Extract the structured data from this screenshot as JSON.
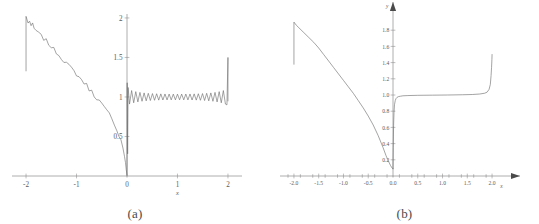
{
  "figure": {
    "background": "#ffffff",
    "curve_color": "#6b6b6b",
    "axis_color": "#7d7d7d",
    "text_color": "#5c5c5c"
  },
  "panels": [
    {
      "id": "a",
      "caption": "(a)",
      "xlabel": "x",
      "ylabel": "",
      "xticks": [
        "-2",
        "-1",
        "0",
        "1",
        "2"
      ],
      "xtick_values": [
        -2,
        -1,
        0,
        1,
        2
      ],
      "yticks": [
        "0.5",
        "1",
        "1.5",
        "2"
      ],
      "ytick_values": [
        0.5,
        1,
        1.5,
        2
      ],
      "xlim": [
        -2.08,
        2.08
      ],
      "ylim": [
        0,
        2.05
      ],
      "grid": "off",
      "axis_arrows": "none"
    },
    {
      "id": "b",
      "caption": "(b)",
      "xlabel": "x",
      "ylabel": "y",
      "xticks": [
        "-2.0",
        "-1.5",
        "-1.0",
        "-0.5",
        "0.0",
        "0.5",
        "1.0",
        "1.5",
        "2.0"
      ],
      "xtick_values": [
        -2.0,
        -1.5,
        -1.0,
        -0.5,
        0.0,
        0.5,
        1.0,
        1.5,
        2.0
      ],
      "yticks": [
        "0.2",
        "0.4",
        "0.6",
        "0.8",
        "1.0",
        "1.2",
        "1.4",
        "1.6",
        "1.8"
      ],
      "ytick_values": [
        0.2,
        0.4,
        0.6,
        0.8,
        1.0,
        1.2,
        1.4,
        1.6,
        1.8
      ],
      "xlim": [
        -2.12,
        2.12
      ],
      "ylim": [
        0,
        2.0
      ],
      "grid": "off",
      "axis_arrows": "both"
    }
  ],
  "chart_data": [
    {
      "type": "line",
      "panel": "a",
      "title": "",
      "subtitle": "",
      "xlabel": "x",
      "ylabel": "",
      "xlim": [
        -2.08,
        2.08
      ],
      "ylim": [
        0,
        2.05
      ],
      "grid": false,
      "legend": "none",
      "annotations": [
        "(a)"
      ],
      "description": "Noisy/oscillatory approximation: left branch rises vertically at x=-2 to about 2.0 then descends with jagged noise to ~0 at x=0; right branch oscillates about y=1 with ripples and spikes up to ~1.5 at x=2.",
      "series": [
        {
          "name": "left-branch",
          "x": [
            -2.0,
            -2.0,
            -1.96,
            -1.93,
            -1.9,
            -1.87,
            -1.84,
            -1.8,
            -1.75,
            -1.7,
            -1.65,
            -1.6,
            -1.55,
            -1.5,
            -1.45,
            -1.4,
            -1.35,
            -1.3,
            -1.25,
            -1.2,
            -1.15,
            -1.1,
            -1.05,
            -1.0,
            -0.95,
            -0.9,
            -0.85,
            -0.8,
            -0.75,
            -0.7,
            -0.65,
            -0.6,
            -0.55,
            -0.5,
            -0.45,
            -0.4,
            -0.35,
            -0.3,
            -0.25,
            -0.2,
            -0.16,
            -0.12,
            -0.08,
            -0.05,
            -0.03,
            -0.015,
            0.0
          ],
          "y": [
            1.33,
            2.02,
            1.93,
            1.97,
            1.9,
            1.91,
            1.86,
            1.84,
            1.8,
            1.77,
            1.74,
            1.71,
            1.67,
            1.64,
            1.6,
            1.57,
            1.53,
            1.5,
            1.46,
            1.43,
            1.39,
            1.36,
            1.32,
            1.29,
            1.25,
            1.22,
            1.18,
            1.15,
            1.1,
            1.07,
            1.02,
            0.99,
            0.95,
            0.91,
            0.86,
            0.82,
            0.78,
            0.71,
            0.67,
            0.58,
            0.52,
            0.45,
            0.36,
            0.26,
            0.17,
            0.08,
            0.01
          ]
        },
        {
          "name": "right-branch",
          "x": [
            0.0,
            0.01,
            0.02,
            0.04,
            0.06,
            0.09,
            0.12,
            0.16,
            0.2,
            0.26,
            0.33,
            0.4,
            0.5,
            0.6,
            0.7,
            0.8,
            0.9,
            1.0,
            1.1,
            1.2,
            1.3,
            1.4,
            1.5,
            1.6,
            1.7,
            1.8,
            1.85,
            1.9,
            1.95,
            1.98,
            2.0,
            2.0
          ],
          "y": [
            0.01,
            0.6,
            1.05,
            0.82,
            1.16,
            0.93,
            1.09,
            0.95,
            1.05,
            0.96,
            1.04,
            0.97,
            1.03,
            0.97,
            1.03,
            0.97,
            1.03,
            0.97,
            1.03,
            0.97,
            1.03,
            0.97,
            1.04,
            0.96,
            1.05,
            0.94,
            1.08,
            0.92,
            1.05,
            0.9,
            1.5,
            0.95
          ]
        }
      ]
    },
    {
      "type": "line",
      "panel": "b",
      "title": "",
      "subtitle": "",
      "xlabel": "x",
      "ylabel": "y",
      "xlim": [
        -2.12,
        2.12
      ],
      "ylim": [
        0,
        2.0
      ],
      "grid": false,
      "legend": "none",
      "annotations": [
        "(b)"
      ],
      "description": "Smooth exact curve: vertical rise at x=-2 to about 1.9, straight linear descent to about 0.1 at x=0, sharp rise to a plateau at y=1.0, then a steep rise to about 1.5 at x=2.",
      "series": [
        {
          "name": "left-branch",
          "x": [
            -2.0,
            -2.0,
            -1.95,
            -1.9,
            -1.8,
            -1.7,
            -1.6,
            -1.5,
            -1.4,
            -1.3,
            -1.2,
            -1.1,
            -1.0,
            -0.9,
            -0.8,
            -0.7,
            -0.6,
            -0.5,
            -0.4,
            -0.3,
            -0.2,
            -0.14,
            -0.09,
            -0.05,
            -0.02,
            -0.005,
            0.0
          ],
          "y": [
            1.38,
            1.9,
            1.86,
            1.83,
            1.77,
            1.71,
            1.65,
            1.58,
            1.5,
            1.42,
            1.34,
            1.26,
            1.18,
            1.1,
            1.02,
            0.93,
            0.84,
            0.74,
            0.63,
            0.5,
            0.35,
            0.25,
            0.18,
            0.13,
            0.1,
            0.09,
            0.09
          ]
        },
        {
          "name": "right-branch",
          "x": [
            0.0,
            0.005,
            0.012,
            0.02,
            0.03,
            0.045,
            0.06,
            0.08,
            0.11,
            0.15,
            0.2,
            0.3,
            0.5,
            0.8,
            1.1,
            1.4,
            1.6,
            1.75,
            1.85,
            1.9,
            1.94,
            1.965,
            1.98,
            1.99,
            1.997,
            2.0
          ],
          "y": [
            0.09,
            0.35,
            0.62,
            0.78,
            0.88,
            0.93,
            0.955,
            0.97,
            0.98,
            0.985,
            0.99,
            0.993,
            0.996,
            0.998,
            1.0,
            1.003,
            1.006,
            1.012,
            1.022,
            1.035,
            1.07,
            1.13,
            1.24,
            1.34,
            1.44,
            1.5
          ]
        }
      ]
    }
  ]
}
